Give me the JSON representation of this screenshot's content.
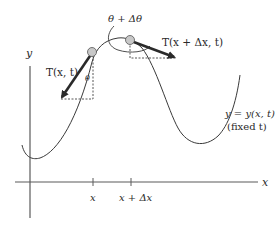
{
  "diagram": {
    "type": "string-tension-element",
    "axes": {
      "x_label": "x",
      "y_label": "y",
      "ticks": [
        {
          "id": "x",
          "label": "x"
        },
        {
          "id": "x_plus_dx",
          "label": "x + Δx"
        }
      ]
    },
    "curve": {
      "equation_label": "y = y(x, t)",
      "note_label": "(fixed t)"
    },
    "points": [
      {
        "id": "left",
        "tension_label": "T(x, t)",
        "angle_label": "θ"
      },
      {
        "id": "right",
        "tension_label": "T(x + Δx, t)"
      }
    ],
    "angle_annotation": "θ + Δθ",
    "colors": {
      "curve": "#3a3a3a",
      "axis": "#5a5a5a",
      "arrow": "#2a2a2a",
      "point_fill": "#c8c8c8",
      "dashed": "#444444"
    }
  }
}
